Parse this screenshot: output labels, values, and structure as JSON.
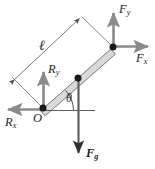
{
  "figure": {
    "background_color": "#ffffff",
    "ink_color": "#1c1c1c",
    "arrow_color": "#8a8a8a",
    "rod_fill_color": "#d9d9d9",
    "rod_stroke_color": "#6e6e6e",
    "node_color": "#1a1a1a",
    "width": 155,
    "height": 169
  },
  "labels": {
    "length": {
      "text": "ℓ",
      "meaning": "rod-length"
    },
    "origin": {
      "text": "O",
      "meaning": "pivot-point"
    },
    "angle": {
      "text": "θ",
      "meaning": "rod-inclination-angle"
    },
    "reaction_x": {
      "base": "R",
      "sub": "x",
      "meaning": "horizontal-reaction-force"
    },
    "reaction_y": {
      "base": "R",
      "sub": "y",
      "meaning": "vertical-reaction-force"
    },
    "force_x": {
      "base": "F",
      "sub": "x",
      "meaning": "horizontal-applied-force"
    },
    "force_y": {
      "base": "F",
      "sub": "y",
      "meaning": "vertical-applied-force"
    },
    "force_gravity": {
      "base": "F",
      "sub": "g",
      "meaning": "gravitational-force"
    }
  },
  "geometry": {
    "pivot_node": {
      "x": 43,
      "y": 108
    },
    "center_node": {
      "x": 78,
      "y": 78
    },
    "tip_node": {
      "x": 113,
      "y": 47
    },
    "dimension_arrow_start": {
      "x": 13,
      "y": 78
    },
    "dimension_arrow_end": {
      "x": 81,
      "y": 17
    }
  }
}
